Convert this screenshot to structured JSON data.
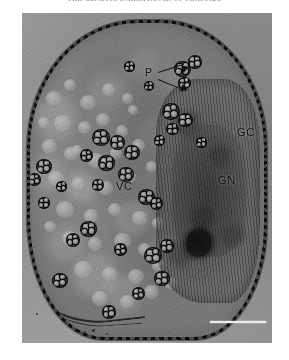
{
  "page": {
    "background_color": "#ffffff",
    "width": 289,
    "height": 360
  },
  "running_head": {
    "text": "THE GENETIC INHERITANCE OF PLASTIDS",
    "note_visible": "clipped at top edge of page"
  },
  "figure": {
    "type": "transmission-electron-micrograph",
    "plate_background_color": "#8d8d8d",
    "labels": [
      {
        "id": "p",
        "text": "P",
        "meaning": "plastid",
        "arrows": 2
      },
      {
        "id": "gc",
        "text": "GC",
        "meaning": "generative cell",
        "arrows": 0
      },
      {
        "id": "gn",
        "text": "GN",
        "meaning": "generative nucleus",
        "arrows": 0
      },
      {
        "id": "vc",
        "text": "VC",
        "meaning": "vegetative cell",
        "arrows": 0
      }
    ],
    "scale_bar": {
      "present": true,
      "color": "#f2f2f2",
      "position": "bottom-right",
      "caption": ""
    },
    "features": {
      "wall_color": "#1d1d1d",
      "nucleolus_color": "#0d0d0d",
      "plastid_count_visible": 28,
      "vesicle_count_visible": 46
    }
  }
}
